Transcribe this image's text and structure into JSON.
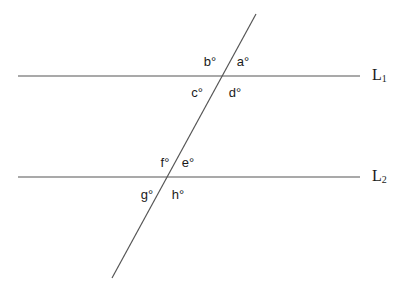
{
  "figure": {
    "background_color": "#ffffff",
    "stroke_color": "#555555",
    "text_color": "#1a1a1a",
    "width": 412,
    "height": 294
  },
  "lines": {
    "l1": {
      "label": "L",
      "subscript": "1",
      "x1": 18,
      "y1": 76,
      "x2": 360,
      "y2": 76,
      "label_x": 372,
      "label_y": 75
    },
    "l2": {
      "label": "L",
      "subscript": "2",
      "x1": 18,
      "y1": 177,
      "x2": 360,
      "y2": 177,
      "label_x": 372,
      "label_y": 176
    },
    "transversal": {
      "name": "transversal",
      "x1": 112,
      "y1": 278,
      "x2": 256,
      "y2": 14
    }
  },
  "intersections": {
    "upper": {
      "x": 222,
      "y": 76
    },
    "lower": {
      "x": 163,
      "y": 177
    }
  },
  "angles": [
    {
      "id": "a",
      "text": "a°",
      "x": 243,
      "y": 61,
      "position": "upper-right",
      "intersection": "upper"
    },
    {
      "id": "b",
      "text": "b°",
      "x": 210,
      "y": 61,
      "position": "upper-left",
      "intersection": "upper"
    },
    {
      "id": "c",
      "text": "c°",
      "x": 197,
      "y": 92,
      "position": "lower-left",
      "intersection": "upper"
    },
    {
      "id": "d",
      "text": "d°",
      "x": 235,
      "y": 92,
      "position": "lower-right",
      "intersection": "upper"
    },
    {
      "id": "e",
      "text": "e°",
      "x": 188,
      "y": 162,
      "position": "upper-right",
      "intersection": "lower"
    },
    {
      "id": "f",
      "text": "f°",
      "x": 165,
      "y": 162,
      "position": "upper-left",
      "intersection": "lower"
    },
    {
      "id": "g",
      "text": "g°",
      "x": 147,
      "y": 194,
      "position": "lower-left",
      "intersection": "lower"
    },
    {
      "id": "h",
      "text": "h°",
      "x": 178,
      "y": 194,
      "position": "lower-right",
      "intersection": "lower"
    }
  ]
}
